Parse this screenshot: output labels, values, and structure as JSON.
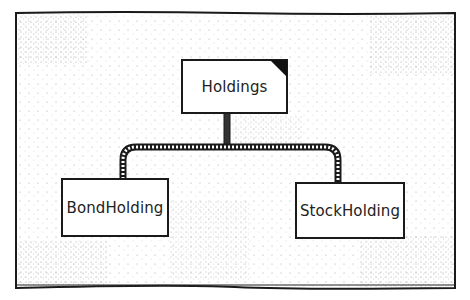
{
  "diagram": {
    "type": "class-hierarchy",
    "style": "hand-drawn stipple",
    "root": {
      "label": "Holdings",
      "marker": "folded-corner"
    },
    "children": [
      {
        "label": "BondHolding"
      },
      {
        "label": "StockHolding"
      }
    ],
    "colors": {
      "ink": "#1a1a1a",
      "paper": "#ffffff"
    }
  }
}
